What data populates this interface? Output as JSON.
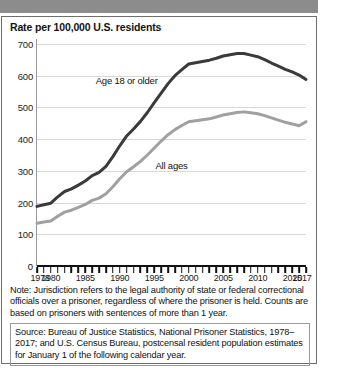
{
  "banner": {
    "name": "top-gray-banner"
  },
  "chart_data": {
    "type": "line",
    "title": "Rate per 100,000 U.S. residents",
    "xlabel": "",
    "ylabel": "",
    "ylim": [
      0,
      700
    ],
    "xlim": [
      1978,
      2017
    ],
    "grid": true,
    "legend_position": "inline-annotation",
    "yticks": [
      700,
      600,
      500,
      400,
      300,
      200,
      100,
      0
    ],
    "ytick_labels": [
      "700",
      "600",
      "500",
      "400",
      "300",
      "200",
      "100",
      "0"
    ],
    "xtick_labels": [
      "1978",
      "1980",
      "1985",
      "1990",
      "1995",
      "2000",
      "2005",
      "2010",
      "2015",
      "2017"
    ],
    "xtick_values": [
      1978,
      1980,
      1985,
      1990,
      1995,
      2000,
      2005,
      2010,
      2015,
      2017
    ],
    "x": [
      1978,
      1979,
      1980,
      1981,
      1982,
      1983,
      1984,
      1985,
      1986,
      1987,
      1988,
      1989,
      1990,
      1991,
      1992,
      1993,
      1994,
      1995,
      1996,
      1997,
      1998,
      1999,
      2000,
      2001,
      2002,
      2003,
      2004,
      2005,
      2006,
      2007,
      2008,
      2009,
      2010,
      2011,
      2012,
      2013,
      2014,
      2015,
      2016,
      2017
    ],
    "series": [
      {
        "name": "Age 18 or older",
        "color": "#3a3a3a",
        "values": [
          188,
          193,
          198,
          218,
          235,
          243,
          255,
          268,
          285,
          295,
          314,
          345,
          379,
          410,
          432,
          456,
          484,
          515,
          545,
          575,
          600,
          619,
          637,
          641,
          645,
          649,
          655,
          662,
          666,
          670,
          670,
          665,
          660,
          651,
          640,
          630,
          620,
          612,
          602,
          588
        ]
      },
      {
        "name": "All ages",
        "color": "#a0a0a0",
        "values": [
          135,
          139,
          142,
          157,
          170,
          176,
          185,
          194,
          207,
          214,
          228,
          250,
          275,
          297,
          313,
          330,
          350,
          372,
          394,
          414,
          430,
          443,
          455,
          458,
          461,
          464,
          470,
          476,
          480,
          484,
          486,
          483,
          480,
          474,
          467,
          460,
          453,
          448,
          442,
          455
        ]
      }
    ],
    "annotations": [
      {
        "text": "Age 18 or older",
        "x": 1991.0,
        "y": 588
      },
      {
        "text": "All ages",
        "x": 1997.5,
        "y": 317
      }
    ]
  },
  "note": "Note: Jurisdiction refers to the legal authority of state or federal correctional officials over a prisoner, regardless of where the prisoner is held. Counts are based on prisoners with sentences of more than 1 year.",
  "source": "Source: Bureau of Justice Statistics, National Prisoner Statistics, 1978–2017; and U.S. Census Bureau, postcensal resident population estimates for January 1 of the following calendar year."
}
